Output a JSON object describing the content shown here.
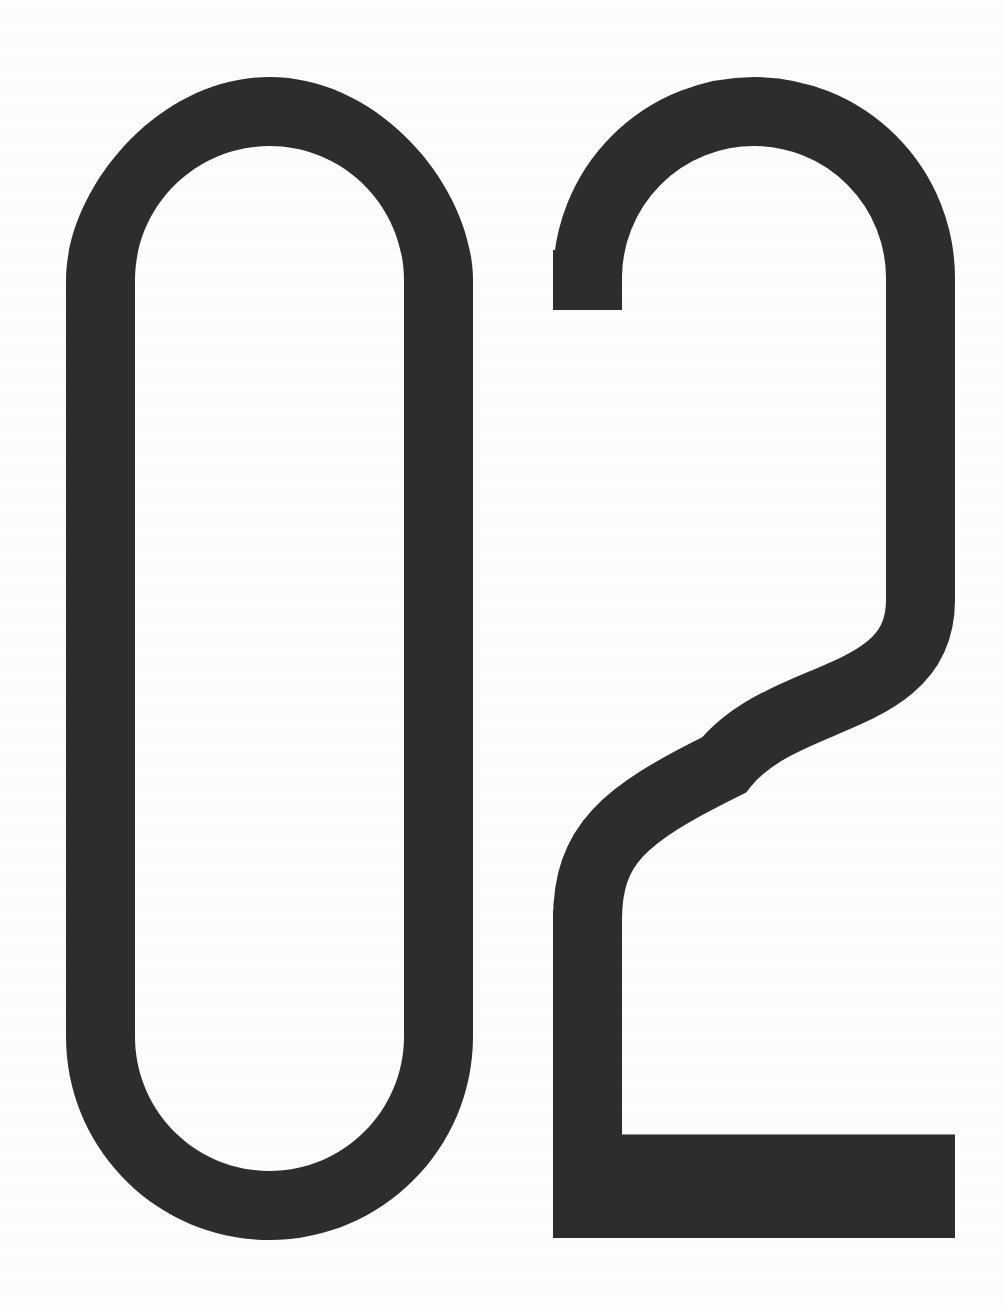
{
  "page": {
    "kind": "full-page-numeral",
    "width": 1005,
    "height": 1305,
    "background_color": "#fefefe",
    "ink_color": "#2e2d2c",
    "label": "02"
  },
  "numerals": {
    "digit_one": {
      "character": "0",
      "name": "zero",
      "stroke_width": 69,
      "bounds": {
        "x": 66,
        "y": 77,
        "width": 407,
        "height": 1163
      }
    },
    "digit_two": {
      "character": "2",
      "name": "two",
      "stroke_width": 69,
      "bounds": {
        "x": 553,
        "y": 77,
        "width": 402,
        "height": 1161
      }
    }
  },
  "colors": {
    "ink": "#2e2d2c",
    "paper": "#fefefe"
  }
}
